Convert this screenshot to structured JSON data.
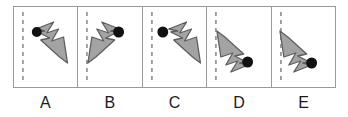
{
  "question_type": "mental-rotation-multiple-choice",
  "colors": {
    "frame_border": "#9a9a9a",
    "arrow_fill": "#a3a3a3",
    "arrow_stroke": "#5e5e5e",
    "dot_fill": "#111111",
    "dashed_line": "#8c8c8c",
    "label_text": "#1b1b1b",
    "background": "#ffffff"
  },
  "options": [
    {
      "id": "A",
      "label": "A",
      "icon": "zigzag-arrow-icon",
      "arrow_direction": "down-right",
      "dot_position": "upper-left",
      "dot_attached": true,
      "dashed_axis": "vertical-left"
    },
    {
      "id": "B",
      "label": "B",
      "icon": "zigzag-arrow-icon",
      "arrow_direction": "down-left",
      "dot_position": "upper-right",
      "dot_attached": true,
      "dashed_axis": "vertical-left"
    },
    {
      "id": "C",
      "label": "C",
      "icon": "zigzag-arrow-icon",
      "arrow_direction": "down-right",
      "dot_position": "upper-left-detached",
      "dot_attached": false,
      "dashed_axis": "vertical-left"
    },
    {
      "id": "D",
      "label": "D",
      "icon": "zigzag-arrow-icon",
      "arrow_direction": "up-left",
      "dot_position": "middle-right",
      "dot_attached": true,
      "dashed_axis": "vertical-left"
    },
    {
      "id": "E",
      "label": "E",
      "icon": "zigzag-arrow-icon",
      "arrow_direction": "up-left",
      "dot_position": "middle-right",
      "dot_attached": true,
      "dashed_axis": "vertical-left"
    }
  ]
}
